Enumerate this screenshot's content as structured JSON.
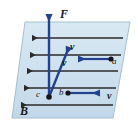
{
  "figure": {
    "type": "physics-vector-diagram",
    "canvas": {
      "width": 138,
      "height": 128,
      "background": "#ffffff"
    },
    "colors": {
      "plane_fill": "#cfe2ef",
      "plane_stroke": "#9fb8c8",
      "vector_blue": "#2d4f9e",
      "arrow_blue": "#1f3f8f",
      "field_line": "#2a2a2a",
      "label_text": "#1a1a1a",
      "point_dot": "#1a1a1a"
    },
    "plane": {
      "name": "magnetic-field-plane",
      "points": "25,22 130,22 113,118 12,118"
    },
    "field_lines": {
      "name": "magnetic-field-lines",
      "label": "B",
      "direction": "leftward",
      "count": 5,
      "lines": [
        {
          "y": 38,
          "x_start": 30,
          "x_end": 123
        },
        {
          "y": 55,
          "x_start": 28,
          "x_end": 121
        },
        {
          "y": 71,
          "x_start": 25,
          "x_end": 118
        },
        {
          "y": 88,
          "x_start": 22,
          "x_end": 116
        },
        {
          "y": 105,
          "x_start": 19,
          "x_end": 113
        }
      ]
    },
    "vectors": [
      {
        "id": "force-F",
        "label": "F",
        "kind": "force",
        "from": [
          49,
          97
        ],
        "to": [
          49,
          10
        ],
        "direction": "up"
      },
      {
        "id": "velocity-c",
        "label": "v",
        "kind": "velocity",
        "from": [
          49,
          97
        ],
        "to": [
          71,
          42
        ],
        "direction": "up-right"
      },
      {
        "id": "velocity-a",
        "label": "v",
        "kind": "velocity",
        "from": [
          110,
          59
        ],
        "to": [
          74,
          59
        ],
        "direction": "left"
      },
      {
        "id": "velocity-b",
        "label": "v",
        "kind": "velocity",
        "from": [
          68,
          93
        ],
        "to": [
          104,
          93
        ],
        "direction": "right"
      }
    ],
    "particles": [
      {
        "id": "a",
        "label": "a",
        "x": 110,
        "y": 59
      },
      {
        "id": "b",
        "label": "b",
        "x": 68,
        "y": 93
      },
      {
        "id": "c",
        "label": "c",
        "x": 49,
        "y": 97
      }
    ],
    "labels": {
      "force": "F",
      "field": "B",
      "velocity": "v",
      "particle_a": "a",
      "particle_b": "b",
      "particle_c": "c"
    }
  }
}
